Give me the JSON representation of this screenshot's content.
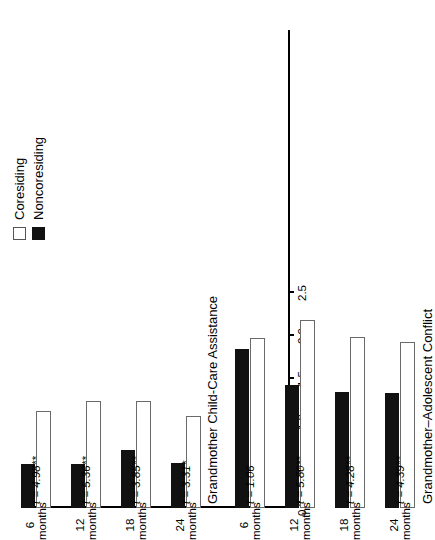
{
  "chart_data": {
    "type": "bar",
    "title": "",
    "orientation": "horizontal-rotated",
    "xlabel": "",
    "ylabel": "",
    "ylim": [
      0.0,
      2.5
    ],
    "axis_ticks": [
      "2.5",
      "2.0",
      "1.5",
      "1.0",
      "0.5",
      "0.0"
    ],
    "axis_tick_values": [
      2.5,
      2.0,
      1.5,
      1.0,
      0.5,
      0.0
    ],
    "grid": false,
    "legend_position": "top-left",
    "categories": [
      "6\nmonths",
      "12\nmonths",
      "18\nmonths",
      "24\nmonths"
    ],
    "legend": [
      "Coresiding",
      "Noncoresiding"
    ],
    "panels": [
      {
        "name": "childcare",
        "title": "Grandmother Child-Care Assistance",
        "categories": [
          "6 months",
          "12 months",
          "18 months",
          "24 months"
        ],
        "series": [
          {
            "name": "Coresiding",
            "values": [
              1.13,
              1.24,
              1.24,
              1.07
            ]
          },
          {
            "name": "Noncoresiding",
            "values": [
              0.51,
              0.51,
              0.67,
              0.52
            ]
          }
        ],
        "stats": [
          "t = 4.98**",
          "t = 5.36**",
          "t = 3.85**",
          "t = 3.31*"
        ]
      },
      {
        "name": "conflict",
        "title": "Grandmother–Adolescent Conflict",
        "categories": [
          "6 months",
          "12 months",
          "18 months",
          "24 months"
        ],
        "series": [
          {
            "name": "Coresiding",
            "values": [
              1.98,
              2.19,
              1.99,
              1.93
            ]
          },
          {
            "name": "Noncoresiding",
            "values": [
              1.85,
              1.43,
              1.35,
              1.34
            ]
          }
        ],
        "stats": [
          "t = 1.06",
          "t = 5.80**",
          "t = 4.28**",
          "t = 4.39**"
        ]
      }
    ],
    "annotations": {
      "footnote": "*p<.01.  **p<.001."
    }
  },
  "legend": {
    "items": [
      {
        "label": "Coresiding",
        "marker": "open-square"
      },
      {
        "label": "Noncoresiding",
        "marker": "filled-square"
      }
    ]
  },
  "axis": {
    "ticks": [
      "2.5",
      "2.0",
      "1.5",
      "1.0",
      "0.5",
      "0.0"
    ]
  },
  "category_labels": [
    {
      "num": "6",
      "unit": "months"
    },
    {
      "num": "12",
      "unit": "months"
    },
    {
      "num": "18",
      "unit": "months"
    },
    {
      "num": "24",
      "unit": "months"
    }
  ],
  "panel_childcare": {
    "title": "Grandmother Child-Care Assistance",
    "stats_line": "t = 4.98**  t = 5.36**  t = 3.85**  t = 3.31*",
    "stat_6": "t = 4.98**",
    "stat_12": "t = 5.36**",
    "stat_18": "t = 3.85**",
    "stat_24": "t = 3.31*"
  },
  "panel_conflict": {
    "title": "Grandmother–Adolescent Conflict",
    "stats_line": "t = 1.06  t = 5.80**  t = 4.28**  t = 4.39**",
    "stat_6": "t = 1.06",
    "stat_12": "t = 5.80**",
    "stat_18": "t = 4.28**",
    "stat_24": "t = 4.39**"
  },
  "footnote": {
    "text": "*p<.01.  **p<.001."
  }
}
